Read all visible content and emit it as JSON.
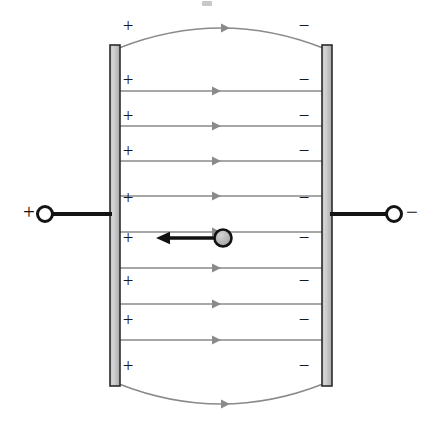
{
  "figure": {
    "type": "physics-diagram",
    "canvas": {
      "width": 441,
      "height": 424,
      "background": "#ffffff"
    }
  },
  "colors": {
    "plate_fill": "#c9c9c9",
    "plate_stroke": "#2b2b2b",
    "field_line": "#8a8a8a",
    "lead_wire": "#141414",
    "terminal_stroke": "#141414",
    "charge_fill": "#b4b4b4",
    "charge_stroke": "#111111",
    "arrow_black": "#111111",
    "sign_color": "#1a1a1a",
    "background": "#ffffff"
  },
  "plates": {
    "left": {
      "name": "positive-plate",
      "x": 110,
      "y": 45,
      "width": 10,
      "height": 341,
      "polarity": "+",
      "charge_count": 9,
      "sign_x": 128,
      "sign_ys": [
        28,
        82,
        118,
        153,
        200,
        240,
        283,
        322,
        368
      ]
    },
    "right": {
      "name": "negative-plate",
      "x": 322,
      "y": 45,
      "width": 10,
      "height": 341,
      "polarity": "−",
      "charge_count": 9,
      "sign_x": 304,
      "sign_ys": [
        28,
        82,
        118,
        153,
        200,
        240,
        283,
        322,
        368
      ]
    }
  },
  "field_lines": {
    "label": "electric-field-lines",
    "direction": "left-to-right (positive plate to negative plate)",
    "color": "#8a8a8a",
    "stroke_width": 1.7,
    "straight_count": 8,
    "straight_ys": [
      91,
      126,
      161,
      196,
      232,
      268,
      304,
      340
    ],
    "x_start": 120,
    "x_end": 322,
    "arrow_x": 212,
    "curved": [
      {
        "name": "top-fringe-field-line",
        "x1": 119,
        "y1": 48,
        "cx": 221,
        "cy": 8,
        "x2": 323,
        "y2": 48,
        "arrow_t": 0.5
      },
      {
        "name": "bottom-fringe-field-line",
        "x1": 119,
        "y1": 384,
        "cx": 221,
        "cy": 424,
        "x2": 323,
        "y2": 384,
        "arrow_t": 0.5
      }
    ]
  },
  "terminals": {
    "left": {
      "name": "positive-terminal",
      "label": "+",
      "label_x": 29,
      "label_y": 214,
      "circle_x": 45,
      "circle_y": 214,
      "circle_r": 7.5,
      "wire_x1": 52,
      "wire_x2": 112,
      "wire_y": 214
    },
    "right": {
      "name": "negative-terminal",
      "label": "−",
      "label_x": 412,
      "label_y": 214,
      "circle_x": 394,
      "circle_y": 214,
      "circle_r": 7.5,
      "wire_x1": 330,
      "wire_x2": 387,
      "wire_y": 214
    }
  },
  "charge": {
    "name": "moving-charge",
    "circle_x": 223,
    "circle_y": 238,
    "circle_r": 8.5,
    "arrow_from_x": 215,
    "arrow_to_x": 156,
    "arrow_y": 238,
    "arrow_direction": "left",
    "arrow_stroke_width": 3.4,
    "description": "negative charge accelerating toward the positive plate"
  },
  "artifact": {
    "name": "top-edge-artifact",
    "x": 202,
    "y": 1,
    "width": 10,
    "height": 5,
    "color": "#9b9b9b"
  }
}
